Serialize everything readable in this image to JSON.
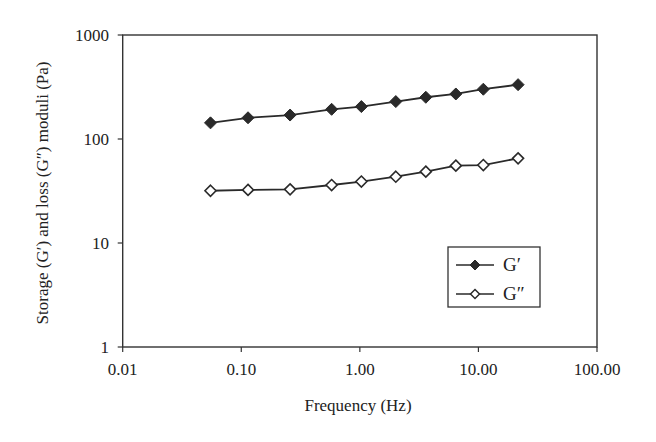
{
  "chart_data": {
    "type": "line",
    "title": "",
    "xlabel": "Frequency (Hz)",
    "ylabel": "Storage (G′) and loss (G″) moduli (Pa)",
    "xscale": "log",
    "yscale": "log",
    "xlim": [
      0.01,
      100
    ],
    "ylim": [
      1,
      1000
    ],
    "grid": false,
    "x_ticks": [
      0.01,
      0.1,
      1,
      10,
      100
    ],
    "x_tick_labels": [
      "0.01",
      "0.10",
      "1.00",
      "10.00",
      "100.00"
    ],
    "y_ticks": [
      1,
      10,
      100,
      1000
    ],
    "y_tick_labels": [
      "1",
      "10",
      "100",
      "1000"
    ],
    "x": [
      0.055,
      0.114,
      0.258,
      0.578,
      1.03,
      2.01,
      3.6,
      6.45,
      11.0,
      21.6
    ],
    "series": [
      {
        "name": "G′",
        "marker": "filled-diamond",
        "values": [
          143,
          160,
          170,
          193,
          205,
          229,
          252,
          271,
          301,
          333
        ]
      },
      {
        "name": "G″",
        "marker": "open-diamond",
        "values": [
          31.8,
          32.4,
          32.8,
          36.1,
          39.0,
          43.4,
          48.5,
          55.4,
          56.2,
          65.2
        ]
      }
    ],
    "legend": {
      "position": "lower-right-inside",
      "entries": [
        "G′",
        "G″"
      ]
    }
  },
  "colors": {
    "line": "#2a2a2a",
    "filled_marker": "#2a2a2a",
    "open_marker_fill": "#ffffff",
    "axis": "#333333"
  }
}
